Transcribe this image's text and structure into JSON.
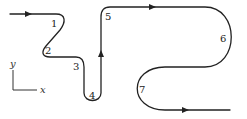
{
  "diagram": {
    "points": [
      {
        "id": "1",
        "label": "1"
      },
      {
        "id": "2",
        "label": "2"
      },
      {
        "id": "3",
        "label": "3"
      },
      {
        "id": "4",
        "label": "4"
      },
      {
        "id": "5",
        "label": "5"
      },
      {
        "id": "6",
        "label": "6"
      },
      {
        "id": "7",
        "label": "7"
      }
    ],
    "axes": {
      "x_label": "x",
      "y_label": "y"
    },
    "colors": {
      "stroke": "#222222"
    }
  }
}
